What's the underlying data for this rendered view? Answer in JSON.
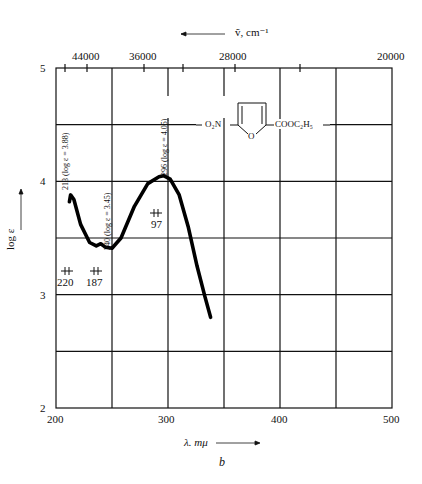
{
  "chart_data": {
    "type": "line",
    "title": "",
    "figure_label": "b",
    "xlabel": "λ. mμ",
    "ylabel": "log ε",
    "top_axis_label": "ṽ, cm⁻¹",
    "xlim": [
      200,
      500
    ],
    "ylim": [
      2,
      5
    ],
    "grid": true,
    "x_ticks": [
      "200",
      "300",
      "400",
      "500"
    ],
    "y_ticks": [
      "2",
      "3",
      "4",
      "5"
    ],
    "top_ticks": [
      "44000",
      "36000",
      "28000",
      "20000"
    ],
    "compound": {
      "left": "O₂N",
      "right": "COOC₂H₅",
      "ring_atom": "O"
    },
    "series": [
      {
        "name": "absorption",
        "x": [
          212,
          213,
          216,
          222,
          230,
          236,
          240,
          244,
          250,
          258,
          270,
          282,
          292,
          296,
          302,
          310,
          318,
          326,
          333,
          338
        ],
        "y": [
          3.82,
          3.88,
          3.84,
          3.62,
          3.46,
          3.43,
          3.45,
          3.42,
          3.41,
          3.5,
          3.78,
          3.98,
          4.04,
          4.05,
          4.02,
          3.88,
          3.6,
          3.25,
          2.98,
          2.8
        ]
      }
    ],
    "annotations": [
      {
        "text": "213 (log ε = 3.88)",
        "x": 213,
        "orientation": "vertical"
      },
      {
        "text": "240 (log ε = 3.45)",
        "x": 240,
        "orientation": "vertical"
      },
      {
        "text": "296 (log ε = 4.05)",
        "x": 296,
        "orientation": "vertical"
      },
      {
        "text": "220",
        "kind": "slit-width"
      },
      {
        "text": "187",
        "kind": "slit-width"
      },
      {
        "text": "97",
        "kind": "slit-width"
      }
    ]
  }
}
